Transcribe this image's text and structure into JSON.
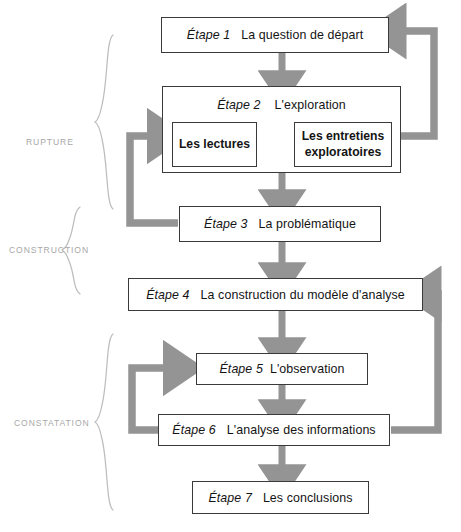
{
  "diagram": {
    "title_visible": false,
    "accent_arrow_color": "#949494",
    "thin_arrow_color": "#3a3a3a",
    "box_border_color": "#3a3a3a",
    "label_color": "#a8a8a8",
    "stages": [
      {
        "id": "etape1",
        "num": "Étape 1",
        "text": "La question de départ"
      },
      {
        "id": "etape2",
        "num": "Étape 2",
        "text": "L'exploration"
      },
      {
        "id": "etape3",
        "num": "Étape 3",
        "text": "La problématique"
      },
      {
        "id": "etape4",
        "num": "Étape 4",
        "text": "La construction du modèle d'analyse"
      },
      {
        "id": "etape5",
        "num": "Étape 5",
        "text": "L'observation"
      },
      {
        "id": "etape6",
        "num": "Étape 6",
        "text": "L'analyse des informations"
      },
      {
        "id": "etape7",
        "num": "Étape 7",
        "text": "Les conclusions"
      }
    ],
    "substages": [
      {
        "id": "lectures",
        "text": "Les lectures"
      },
      {
        "id": "entretiens",
        "text": "Les entretiens exploratoires"
      }
    ],
    "phase_labels": [
      {
        "id": "rupture",
        "text": "RUPTURE"
      },
      {
        "id": "construction",
        "text": "CONSTRUCTION"
      },
      {
        "id": "constatation",
        "text": "CONSTATATION"
      }
    ],
    "flow": {
      "forward_sequence": [
        "Étape 1",
        "Étape 2",
        "Étape 3",
        "Étape 4",
        "Étape 5",
        "Étape 6",
        "Étape 7"
      ],
      "feedback_loops": [
        {
          "from": "Étape 2",
          "to": "Étape 1",
          "side": "right"
        },
        {
          "from": "Étape 3",
          "to": "Les lectures",
          "side": "left"
        },
        {
          "from": "Étape 6",
          "to": "Étape 4",
          "side": "right"
        },
        {
          "from": "Étape 6",
          "to": "Étape 5",
          "side": "left"
        }
      ],
      "bidirectional": [
        {
          "from": "Les lectures",
          "to": "Les entretiens exploratoires"
        }
      ]
    }
  }
}
